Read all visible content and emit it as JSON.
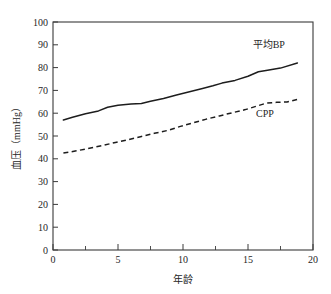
{
  "chart_data": {
    "type": "line",
    "title": "",
    "xlabel": "年龄",
    "ylabel": "血压（mmHg）",
    "xlim": [
      0,
      20
    ],
    "ylim": [
      0,
      100
    ],
    "grid": false,
    "legend_position": "inline-annotation",
    "x_ticks": [
      0,
      5,
      10,
      15,
      20
    ],
    "x_tick_labels": [
      "0",
      "5",
      "10",
      "15",
      "20"
    ],
    "x_minor_ticks": [
      2.5,
      7.5,
      12.5,
      17.5
    ],
    "y_ticks": [
      0,
      10,
      20,
      30,
      40,
      50,
      60,
      70,
      80,
      90,
      100
    ],
    "y_tick_labels": [
      "0",
      "10",
      "20",
      "30",
      "40",
      "50",
      "60",
      "70",
      "80",
      "90",
      "100"
    ],
    "series": [
      {
        "name": "平均BP",
        "style": "solid",
        "color": "#1d1d1d",
        "x": [
          0.8,
          1.5,
          2.5,
          3.5,
          4.2,
          5.0,
          6.0,
          6.8,
          7.5,
          8.5,
          9.5,
          10.5,
          11.5,
          12.3,
          13.0,
          14.0,
          15.0,
          15.8,
          16.5,
          17.5,
          18.8
        ],
        "y": [
          57.0,
          58.2,
          59.8,
          61.0,
          62.6,
          63.5,
          64.0,
          64.3,
          65.2,
          66.5,
          68.0,
          69.4,
          70.8,
          72.0,
          73.2,
          74.4,
          76.2,
          78.2,
          78.8,
          79.8,
          82.0
        ]
      },
      {
        "name": "CPP",
        "style": "dashed",
        "color": "#1d1d1d",
        "x": [
          0.8,
          1.8,
          2.8,
          3.8,
          4.8,
          5.8,
          6.8,
          7.8,
          8.8,
          9.8,
          10.8,
          11.8,
          12.8,
          13.8,
          14.8,
          15.6,
          16.4,
          17.2,
          18.0,
          18.8
        ],
        "y": [
          42.5,
          43.5,
          44.6,
          45.8,
          47.2,
          48.4,
          49.8,
          51.2,
          52.4,
          54.2,
          55.8,
          57.4,
          58.8,
          60.2,
          61.6,
          63.0,
          64.4,
          64.8,
          64.9,
          66.0
        ]
      }
    ],
    "annotations": [
      {
        "text": "平均BP",
        "x": 16.6,
        "y": 88.5,
        "name": "series-label-mean-bp"
      },
      {
        "text": "CPP",
        "x": 16.3,
        "y": 58.5,
        "name": "series-label-cpp"
      }
    ],
    "colors": {
      "axis": "#3a3a3a",
      "text": "#262626",
      "line": "#1d1d1d",
      "background": "#ffffff"
    }
  }
}
